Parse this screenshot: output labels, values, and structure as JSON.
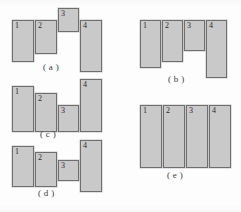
{
  "figure": {
    "style": {
      "block_fill": "#c9c9c9",
      "block_border": "#6e6e6e",
      "background": "#fdfdfd",
      "text_color": "#2b2b2b"
    },
    "panels": [
      {
        "id": "panel-a",
        "caption": "( a )",
        "caption_x": 43,
        "caption_y": 62,
        "blocks": [
          {
            "label": "1",
            "x": 12,
            "y": 20,
            "w": 22,
            "h": 42
          },
          {
            "label": "2",
            "x": 35,
            "y": 20,
            "w": 22,
            "h": 34
          },
          {
            "label": "3",
            "x": 58,
            "y": 8,
            "w": 21,
            "h": 24
          },
          {
            "label": "4",
            "x": 80,
            "y": 20,
            "w": 22,
            "h": 52
          }
        ]
      },
      {
        "id": "panel-b",
        "caption": "( b )",
        "caption_x": 168,
        "caption_y": 74,
        "blocks": [
          {
            "label": "1",
            "x": 140,
            "y": 20,
            "w": 21,
            "h": 48
          },
          {
            "label": "2",
            "x": 162,
            "y": 20,
            "w": 21,
            "h": 42
          },
          {
            "label": "3",
            "x": 184,
            "y": 20,
            "w": 21,
            "h": 31
          },
          {
            "label": "4",
            "x": 206,
            "y": 20,
            "w": 21,
            "h": 58
          }
        ]
      },
      {
        "id": "panel-c",
        "caption": "( c )",
        "caption_x": 40,
        "caption_y": 129,
        "blocks": [
          {
            "label": "1",
            "x": 12,
            "y": 86,
            "w": 22,
            "h": 46
          },
          {
            "label": "2",
            "x": 35,
            "y": 93,
            "w": 22,
            "h": 39
          },
          {
            "label": "3",
            "x": 58,
            "y": 105,
            "w": 21,
            "h": 27
          },
          {
            "label": "4",
            "x": 80,
            "y": 79,
            "w": 22,
            "h": 53
          }
        ]
      },
      {
        "id": "panel-d",
        "caption": "( d )",
        "caption_x": 38,
        "caption_y": 188,
        "blocks": [
          {
            "label": "1",
            "x": 12,
            "y": 146,
            "w": 22,
            "h": 41
          },
          {
            "label": "2",
            "x": 35,
            "y": 152,
            "w": 22,
            "h": 35
          },
          {
            "label": "3",
            "x": 58,
            "y": 160,
            "w": 21,
            "h": 21
          },
          {
            "label": "4",
            "x": 80,
            "y": 140,
            "w": 22,
            "h": 52
          }
        ]
      },
      {
        "id": "panel-e",
        "caption": "( e )",
        "caption_x": 167,
        "caption_y": 170,
        "blocks": [
          {
            "label": "1",
            "x": 140,
            "y": 105,
            "w": 22,
            "h": 63
          },
          {
            "label": "2",
            "x": 163,
            "y": 105,
            "w": 22,
            "h": 63
          },
          {
            "label": "3",
            "x": 186,
            "y": 105,
            "w": 22,
            "h": 63
          },
          {
            "label": "4",
            "x": 209,
            "y": 105,
            "w": 22,
            "h": 63
          }
        ]
      }
    ]
  }
}
